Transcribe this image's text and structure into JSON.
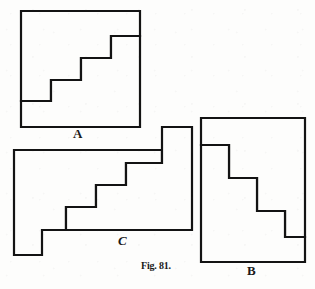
{
  "figure": {
    "caption": "Fig. 81.",
    "background_color": "#fdfdfc",
    "ink_color": "#131313",
    "canvas": {
      "width": 315,
      "height": 289
    }
  },
  "labels": {
    "a": "A",
    "b": "B",
    "c": "C"
  },
  "shapes": {
    "a": {
      "name": "A",
      "kind": "square-with-internal-staircase",
      "outline_points": "21,11 140,11 140,127 21,127",
      "staircase_points": "21,101 51,101 51,80 81,80 81,58 111,58 111,36 140,36",
      "bounds": {
        "x": 21,
        "y": 11,
        "width": 119,
        "height": 116
      },
      "steps": 4
    },
    "b": {
      "name": "B",
      "kind": "rectangle-with-internal-staircase",
      "outline_points": "201,118 305,118 305,262 201,262",
      "staircase_points": "201,145 229,145 229,178 257,178 257,211 285,211 285,237 305,237",
      "bounds": {
        "x": 201,
        "y": 118,
        "width": 104,
        "height": 144
      },
      "steps": 4
    },
    "c": {
      "name": "C",
      "kind": "stepped-polygon-with-internal-staircase",
      "outline_points": "14,150 162,150 162,127 192,127 192,230 42,230 42,255 14,255",
      "staircase_points": "14,150 162,150 162,127 192,127 192,230 42,230 42,255 14,255",
      "inner_staircase_points": "66,230 66,207 96,207 96,185 126,185 126,163 162,163",
      "bounds": {
        "x": 14,
        "y": 127,
        "width": 178,
        "height": 128
      },
      "steps": 3
    }
  }
}
